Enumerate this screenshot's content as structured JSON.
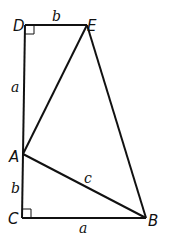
{
  "diagram": {
    "points": {
      "D": {
        "label": "D",
        "x": 25,
        "y": 25
      },
      "E": {
        "label": "E",
        "x": 87,
        "y": 25
      },
      "A": {
        "label": "A",
        "x": 23,
        "y": 154
      },
      "C": {
        "label": "C",
        "x": 22,
        "y": 218
      },
      "B": {
        "label": "B",
        "x": 146,
        "y": 218
      }
    },
    "segment_labels": {
      "DE": "b",
      "DA": "a",
      "AC": "b",
      "CB": "a",
      "AB": "c"
    },
    "right_angles": [
      "D",
      "C"
    ],
    "stroke_color": "#111111"
  }
}
